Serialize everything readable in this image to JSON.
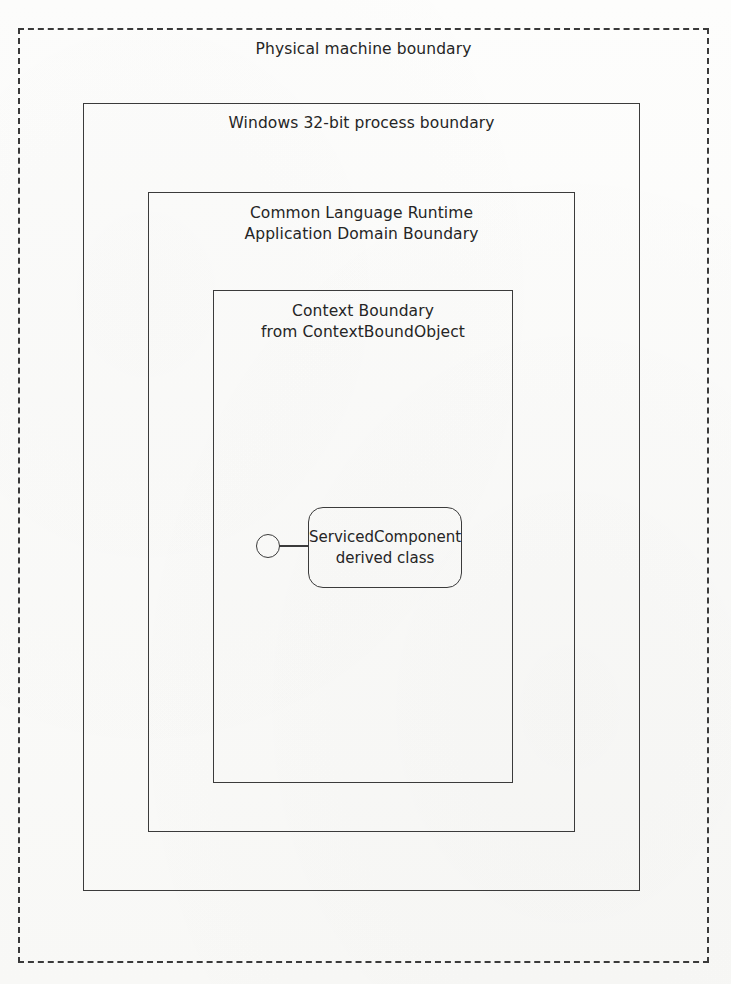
{
  "figure": {
    "type": "nested-boundary-diagram",
    "title_implied": "Physical machine boundary"
  },
  "boundaries": {
    "physical_machine": {
      "label": "Physical machine boundary",
      "style": "dashed",
      "stroke": "#3a3a3a"
    },
    "windows_process": {
      "label": "Windows 32-bit process boundary",
      "style": "solid",
      "stroke": "#3b3b3b"
    },
    "clr_appdomain": {
      "label": "Common Language Runtime\nApplication Domain Boundary",
      "style": "solid",
      "stroke": "#3b3b3b"
    },
    "context": {
      "label": "Context Boundary\nfrom ContextBoundObject",
      "style": "solid",
      "stroke": "#3b3b3b"
    }
  },
  "component": {
    "label": "ServicedComponent\nderived class",
    "interface_icon": "lollipop-interface",
    "stroke": "#3b3b3b"
  }
}
